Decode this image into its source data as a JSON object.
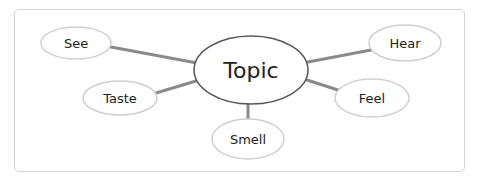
{
  "diagram": {
    "type": "mind-map",
    "center": {
      "label": "Topic"
    },
    "nodes": [
      {
        "label": "See"
      },
      {
        "label": "Taste"
      },
      {
        "label": "Smell"
      },
      {
        "label": "Feel"
      },
      {
        "label": "Hear"
      }
    ],
    "colors": {
      "border": "#d4d4d4",
      "node_stroke": "#d0d0d0",
      "center_stroke": "#555555",
      "connector": "#8a8a8a",
      "text": "#222222"
    }
  }
}
